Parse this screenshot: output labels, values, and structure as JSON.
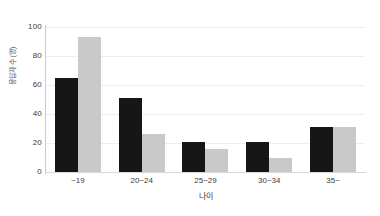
{
  "chart_data": {
    "type": "bar",
    "title": "",
    "subtitle": "",
    "xlabel": "나이",
    "ylabel": "응답자 수 (명)",
    "categories": [
      "~19",
      "20~24",
      "25~29",
      "30~34",
      "35~"
    ],
    "series": [
      {
        "name": "series-dark",
        "color": "#161616",
        "values": [
          65,
          51,
          21,
          21,
          31
        ]
      },
      {
        "name": "series-light",
        "color": "#c9c9c9",
        "values": [
          93,
          26,
          16,
          10,
          31
        ]
      }
    ],
    "ylim": [
      0,
      100
    ],
    "yticks": [
      100,
      80,
      60,
      40,
      20,
      0
    ],
    "ytick_labels": [
      "100",
      "80",
      "60",
      "40",
      "20",
      "0"
    ],
    "grid": true,
    "legend": "none",
    "background": "#ffffff",
    "axis_color": "#c9c9c9",
    "grid_color": "#eceff1"
  }
}
